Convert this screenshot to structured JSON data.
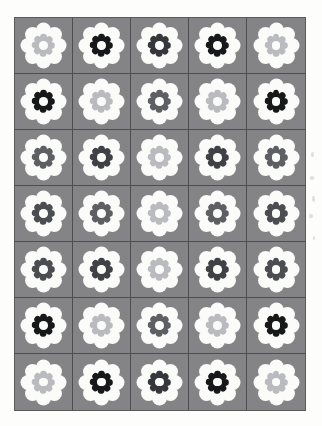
{
  "page": {
    "kind": "printed-pattern-sheet",
    "background_color": "#fdfdfc",
    "grid_border_color": "#59595a"
  },
  "grid": {
    "columns": 5,
    "rows": 7,
    "cell_background_color": "#848486",
    "cell_divider_color": "#4e4e50",
    "total_cells": 35
  },
  "motif": {
    "name": "eight-petal-flower",
    "outer_petal_count": 8,
    "inner_petal_count": 8,
    "outer_petal_color": "#fbfbf9",
    "center_color": "#fbfbf9"
  },
  "palette": {
    "black": "#17181a",
    "dark_gray": "#5d5f63",
    "mid_gray": "#8f9197",
    "light_gray": "#b9bbbf"
  },
  "cells": [
    {
      "row": 1,
      "col": 1,
      "inner_color": "#b9bbbf",
      "tone": "light_gray"
    },
    {
      "row": 1,
      "col": 2,
      "inner_color": "#17181a",
      "tone": "black"
    },
    {
      "row": 1,
      "col": 3,
      "inner_color": "#35373b",
      "tone": "near_black"
    },
    {
      "row": 1,
      "col": 4,
      "inner_color": "#17181a",
      "tone": "black"
    },
    {
      "row": 1,
      "col": 5,
      "inner_color": "#b9bbbf",
      "tone": "light_gray"
    },
    {
      "row": 2,
      "col": 1,
      "inner_color": "#17181a",
      "tone": "black"
    },
    {
      "row": 2,
      "col": 2,
      "inner_color": "#b9bbbf",
      "tone": "light_gray"
    },
    {
      "row": 2,
      "col": 3,
      "inner_color": "#5d5f63",
      "tone": "dark_gray"
    },
    {
      "row": 2,
      "col": 4,
      "inner_color": "#b9bbbf",
      "tone": "light_gray"
    },
    {
      "row": 2,
      "col": 5,
      "inner_color": "#17181a",
      "tone": "black"
    },
    {
      "row": 3,
      "col": 1,
      "inner_color": "#5d5f63",
      "tone": "dark_gray"
    },
    {
      "row": 3,
      "col": 2,
      "inner_color": "#3f4145",
      "tone": "dark_gray"
    },
    {
      "row": 3,
      "col": 3,
      "inner_color": "#b9bbbf",
      "tone": "light_gray"
    },
    {
      "row": 3,
      "col": 4,
      "inner_color": "#3f4145",
      "tone": "dark_gray"
    },
    {
      "row": 3,
      "col": 5,
      "inner_color": "#5d5f63",
      "tone": "dark_gray"
    },
    {
      "row": 4,
      "col": 1,
      "inner_color": "#4b4d51",
      "tone": "dark_gray"
    },
    {
      "row": 4,
      "col": 2,
      "inner_color": "#5d5f63",
      "tone": "dark_gray"
    },
    {
      "row": 4,
      "col": 3,
      "inner_color": "#b9bbbf",
      "tone": "light_gray"
    },
    {
      "row": 4,
      "col": 4,
      "inner_color": "#5d5f63",
      "tone": "dark_gray"
    },
    {
      "row": 4,
      "col": 5,
      "inner_color": "#4b4d51",
      "tone": "dark_gray"
    },
    {
      "row": 5,
      "col": 1,
      "inner_color": "#4b4d51",
      "tone": "dark_gray"
    },
    {
      "row": 5,
      "col": 2,
      "inner_color": "#3f4145",
      "tone": "dark_gray"
    },
    {
      "row": 5,
      "col": 3,
      "inner_color": "#b9bbbf",
      "tone": "light_gray"
    },
    {
      "row": 5,
      "col": 4,
      "inner_color": "#3f4145",
      "tone": "dark_gray"
    },
    {
      "row": 5,
      "col": 5,
      "inner_color": "#4b4d51",
      "tone": "dark_gray"
    },
    {
      "row": 6,
      "col": 1,
      "inner_color": "#17181a",
      "tone": "black"
    },
    {
      "row": 6,
      "col": 2,
      "inner_color": "#b9bbbf",
      "tone": "light_gray"
    },
    {
      "row": 6,
      "col": 3,
      "inner_color": "#5d5f63",
      "tone": "dark_gray"
    },
    {
      "row": 6,
      "col": 4,
      "inner_color": "#b9bbbf",
      "tone": "light_gray"
    },
    {
      "row": 6,
      "col": 5,
      "inner_color": "#17181a",
      "tone": "black"
    },
    {
      "row": 7,
      "col": 1,
      "inner_color": "#b9bbbf",
      "tone": "light_gray"
    },
    {
      "row": 7,
      "col": 2,
      "inner_color": "#17181a",
      "tone": "black"
    },
    {
      "row": 7,
      "col": 3,
      "inner_color": "#35373b",
      "tone": "near_black"
    },
    {
      "row": 7,
      "col": 4,
      "inner_color": "#17181a",
      "tone": "black"
    },
    {
      "row": 7,
      "col": 5,
      "inner_color": "#b9bbbf",
      "tone": "light_gray"
    }
  ],
  "margin_marks": [
    {
      "x": 311,
      "y": 152,
      "w": 3,
      "h": 5
    },
    {
      "x": 310,
      "y": 176,
      "w": 4,
      "h": 4
    },
    {
      "x": 312,
      "y": 196,
      "w": 3,
      "h": 6
    },
    {
      "x": 309,
      "y": 214,
      "w": 4,
      "h": 4
    },
    {
      "x": 313,
      "y": 236,
      "w": 2,
      "h": 4
    }
  ]
}
